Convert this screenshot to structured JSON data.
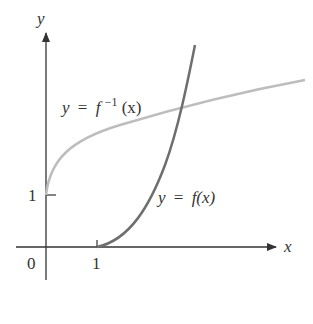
{
  "axes": {
    "x_label": "x",
    "y_label": "y",
    "origin_label": "0",
    "x_tick_label": "1",
    "y_tick_label": "1"
  },
  "curves": {
    "f": {
      "label_y": "y",
      "label_eq": "=",
      "label_fn": "f(x)",
      "color": "#6e6e6e"
    },
    "f_inverse": {
      "label_y": "y",
      "label_eq": "=",
      "label_f": "f",
      "label_sup": "−1",
      "label_arg": "(x)",
      "color": "#bdbdbd"
    }
  },
  "colors": {
    "axis": "#333333",
    "background": "#ffffff"
  }
}
